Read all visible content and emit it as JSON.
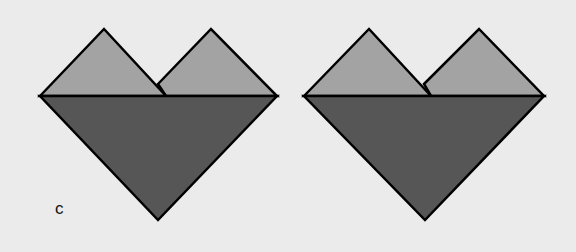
{
  "figure": {
    "label": "c",
    "colors": {
      "background": "#ebebeb",
      "light_fill": "#a3a3a3",
      "dark_fill": "#565656",
      "stroke": "#000000"
    },
    "hearts": [
      {
        "name": "heart-left",
        "top_left_triangle": [
          [
            40,
            96
          ],
          [
            104,
            29
          ],
          [
            166,
            96
          ]
        ],
        "top_right_triangle": [
          [
            158,
            84
          ],
          [
            211,
            29
          ],
          [
            277,
            96
          ]
        ],
        "bottom_triangle": [
          [
            40,
            96
          ],
          [
            277,
            96
          ],
          [
            158,
            220
          ]
        ]
      },
      {
        "name": "heart-right",
        "top_left_triangle": [
          [
            304,
            96
          ],
          [
            369,
            29
          ],
          [
            431,
            96
          ]
        ],
        "top_right_triangle": [
          [
            424,
            84
          ],
          [
            479,
            29
          ],
          [
            544,
            96
          ]
        ],
        "bottom_triangle": [
          [
            304,
            96
          ],
          [
            544,
            96
          ],
          [
            425,
            220
          ]
        ]
      }
    ]
  }
}
